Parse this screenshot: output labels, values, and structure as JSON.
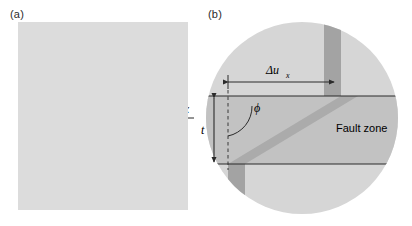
{
  "figure": {
    "type": "two-panel scientific diagram",
    "background_color": "#ffffff"
  },
  "panel_a": {
    "label": "(a)",
    "background_color": "#dcdcdc",
    "axes": {
      "y_label": "y",
      "x_label": "x"
    },
    "annotations": {
      "half_length_label": "a",
      "full_length_label": "2a",
      "slip_label": "u",
      "slip_subscript": "x",
      "angle_label": "ϕ",
      "angle_subscript": "e",
      "fault_label": "Fault"
    },
    "fault_color": "#9a9a9a",
    "line_color": "#2b2b2b"
  },
  "panel_b": {
    "label": "(b)",
    "circle_color": "#d2d2d2",
    "zone_color": "#c0c0c0",
    "marker_band_color": "#9e9e9e",
    "line_color": "#2b2b2b",
    "annotations": {
      "offset_label": "Δu",
      "offset_subscript": "x",
      "thickness_label": "t",
      "angle_label": "ϕ",
      "zone_label": "Fault zone"
    }
  }
}
